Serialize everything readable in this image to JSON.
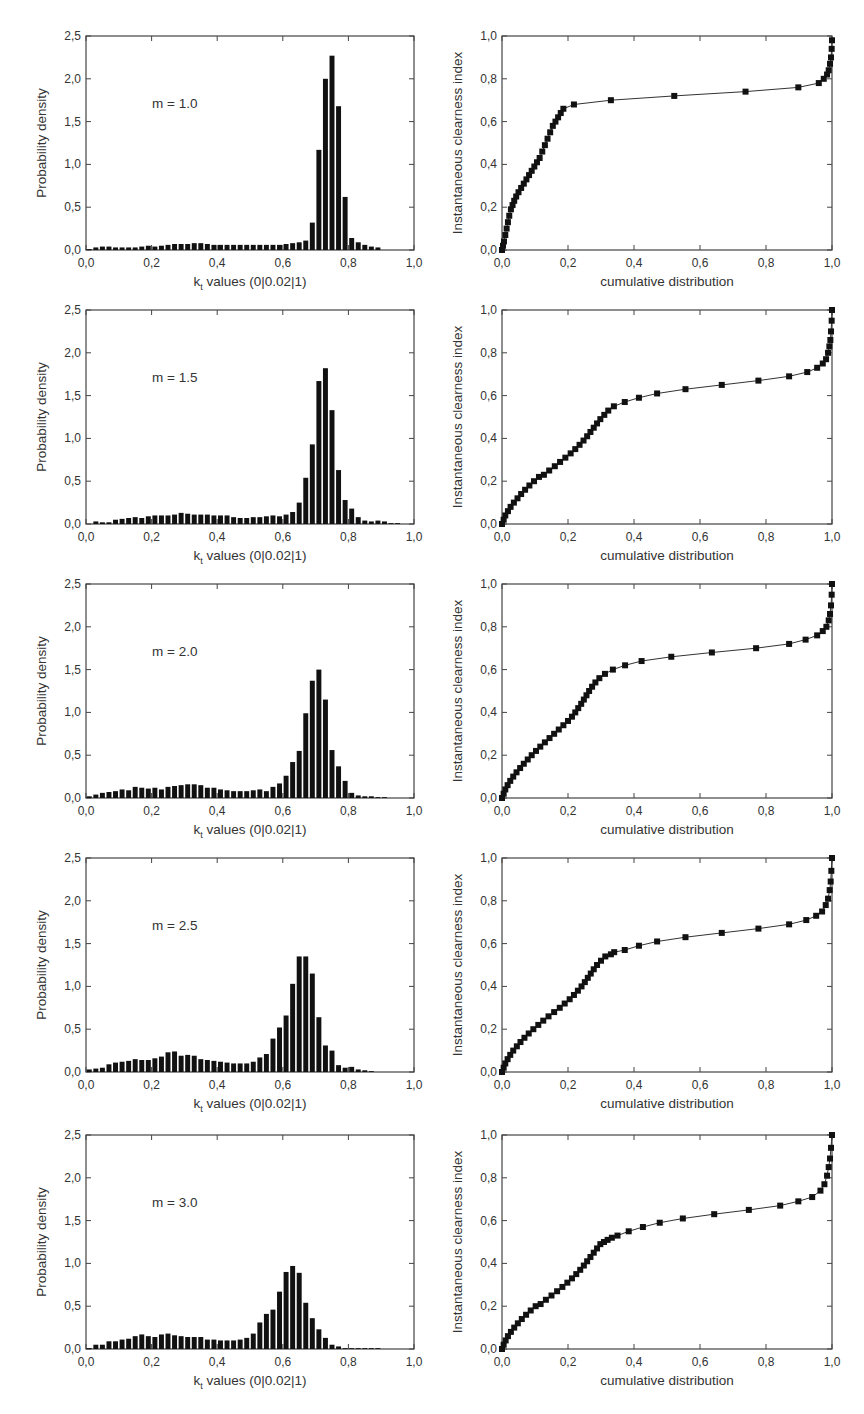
{
  "header": {
    "cut_text": ""
  },
  "layout": {
    "row_tops": [
      36,
      310,
      584,
      858,
      1135
    ],
    "plot_height": 214,
    "left_plot": {
      "x0": 86,
      "x1": 414
    },
    "right_plot": {
      "x0": 502,
      "x1": 832
    }
  },
  "colors": {
    "bar": "#111111",
    "axis": "#444444",
    "marker": "#111111",
    "line": "#333333"
  },
  "chart_data": [
    {
      "type": "bar",
      "panel": "histogram",
      "annotation": "m = 1.0",
      "xlabel": "k_t values (0|0.02|1)",
      "ylabel": "Probability density",
      "xlim": [
        0,
        1
      ],
      "ylim": [
        0,
        2.5
      ],
      "xticks": [
        "0,0",
        "0,2",
        "0,4",
        "0,6",
        "0,8",
        "1,0"
      ],
      "yticks": [
        "0,0",
        "0,5",
        "1,0",
        "1,5",
        "2,0",
        "2,5"
      ],
      "bin_width": 0.02,
      "values": [
        0.01,
        0.03,
        0.04,
        0.04,
        0.03,
        0.03,
        0.03,
        0.03,
        0.04,
        0.05,
        0.04,
        0.05,
        0.06,
        0.07,
        0.07,
        0.07,
        0.08,
        0.08,
        0.07,
        0.06,
        0.06,
        0.06,
        0.06,
        0.06,
        0.06,
        0.06,
        0.06,
        0.06,
        0.06,
        0.06,
        0.07,
        0.08,
        0.09,
        0.11,
        0.32,
        1.17,
        2.0,
        2.27,
        1.68,
        0.62,
        0.14,
        0.09,
        0.06,
        0.04,
        0.03,
        0.0,
        0.0,
        0.0,
        0.0,
        0.0
      ]
    },
    {
      "type": "scatter",
      "panel": "cumulative",
      "mode": "lines+markers",
      "xlabel": "cumulative distribution",
      "ylabel": "Instantaneous clearness index",
      "xlim": [
        0,
        1
      ],
      "ylim": [
        0,
        1
      ],
      "xticks": [
        "0,0",
        "0,2",
        "0,4",
        "0,6",
        "0,8",
        "1,0"
      ],
      "yticks": [
        "0,0",
        "0,2",
        "0,4",
        "0,6",
        "0,8",
        "1,0"
      ],
      "x": [
        0.0,
        0.003,
        0.006,
        0.01,
        0.014,
        0.018,
        0.022,
        0.027,
        0.032,
        0.037,
        0.043,
        0.05,
        0.058,
        0.066,
        0.074,
        0.082,
        0.09,
        0.098,
        0.106,
        0.114,
        0.122,
        0.13,
        0.138,
        0.146,
        0.154,
        0.162,
        0.17,
        0.178,
        0.186,
        0.218,
        0.33,
        0.522,
        0.738,
        0.898,
        0.96,
        0.975,
        0.985,
        0.99,
        0.994,
        0.997,
        0.999,
        1.0
      ],
      "y": [
        0.0,
        0.02,
        0.04,
        0.07,
        0.1,
        0.13,
        0.16,
        0.19,
        0.21,
        0.23,
        0.25,
        0.27,
        0.29,
        0.31,
        0.33,
        0.35,
        0.37,
        0.39,
        0.41,
        0.43,
        0.46,
        0.49,
        0.52,
        0.55,
        0.58,
        0.6,
        0.62,
        0.64,
        0.66,
        0.68,
        0.7,
        0.72,
        0.74,
        0.76,
        0.78,
        0.8,
        0.82,
        0.84,
        0.87,
        0.9,
        0.94,
        0.98
      ]
    },
    {
      "type": "bar",
      "panel": "histogram",
      "annotation": "m = 1.5",
      "xlabel": "k_t values (0|0.02|1)",
      "ylabel": "Probability density",
      "xlim": [
        0,
        1
      ],
      "ylim": [
        0,
        2.5
      ],
      "xticks": [
        "0,0",
        "0,2",
        "0,4",
        "0,6",
        "0,8",
        "1,0"
      ],
      "yticks": [
        "0,0",
        "0,5",
        "1,0",
        "1,5",
        "2,0",
        "2,5"
      ],
      "bin_width": 0.02,
      "values": [
        0.0,
        0.03,
        0.02,
        0.02,
        0.05,
        0.06,
        0.07,
        0.08,
        0.07,
        0.09,
        0.1,
        0.1,
        0.1,
        0.11,
        0.13,
        0.12,
        0.11,
        0.11,
        0.11,
        0.1,
        0.1,
        0.1,
        0.08,
        0.07,
        0.07,
        0.08,
        0.08,
        0.09,
        0.1,
        0.09,
        0.11,
        0.14,
        0.25,
        0.54,
        0.93,
        1.67,
        1.82,
        1.33,
        0.63,
        0.28,
        0.18,
        0.08,
        0.04,
        0.03,
        0.04,
        0.03,
        0.01,
        0.01,
        0.0,
        0.0
      ]
    },
    {
      "type": "scatter",
      "panel": "cumulative",
      "mode": "lines+markers",
      "xlabel": "cumulative distribution",
      "ylabel": "Instantaneous clearness index",
      "xlim": [
        0,
        1
      ],
      "ylim": [
        0,
        1
      ],
      "xticks": [
        "0,0",
        "0,2",
        "0,4",
        "0,6",
        "0,8",
        "1,0"
      ],
      "yticks": [
        "0,0",
        "0,2",
        "0,4",
        "0,6",
        "0,8",
        "1,0"
      ],
      "x": [
        0.0,
        0.005,
        0.01,
        0.018,
        0.026,
        0.036,
        0.047,
        0.058,
        0.07,
        0.083,
        0.097,
        0.112,
        0.127,
        0.143,
        0.16,
        0.176,
        0.192,
        0.208,
        0.222,
        0.235,
        0.247,
        0.258,
        0.268,
        0.278,
        0.288,
        0.298,
        0.31,
        0.322,
        0.339,
        0.372,
        0.415,
        0.47,
        0.556,
        0.666,
        0.777,
        0.87,
        0.925,
        0.955,
        0.972,
        0.982,
        0.988,
        0.992,
        0.995,
        0.997,
        0.999,
        1.0
      ],
      "y": [
        0.0,
        0.02,
        0.04,
        0.06,
        0.08,
        0.1,
        0.12,
        0.14,
        0.16,
        0.18,
        0.2,
        0.22,
        0.23,
        0.25,
        0.27,
        0.29,
        0.31,
        0.33,
        0.35,
        0.37,
        0.39,
        0.41,
        0.43,
        0.45,
        0.47,
        0.49,
        0.51,
        0.53,
        0.55,
        0.57,
        0.59,
        0.61,
        0.63,
        0.65,
        0.67,
        0.69,
        0.71,
        0.73,
        0.75,
        0.77,
        0.8,
        0.83,
        0.86,
        0.9,
        0.95,
        1.0
      ]
    },
    {
      "type": "bar",
      "panel": "histogram",
      "annotation": "m = 2.0",
      "xlabel": "k_t values (0|0.02|1)",
      "ylabel": "Probability density",
      "xlim": [
        0,
        1
      ],
      "ylim": [
        0,
        2.5
      ],
      "xticks": [
        "0,0",
        "0,2",
        "0,4",
        "0,6",
        "0,8",
        "1,0"
      ],
      "yticks": [
        "0,0",
        "0,5",
        "1,0",
        "1,5",
        "2,0",
        "2,5"
      ],
      "bin_width": 0.02,
      "values": [
        0.02,
        0.04,
        0.06,
        0.07,
        0.08,
        0.1,
        0.09,
        0.13,
        0.12,
        0.11,
        0.12,
        0.1,
        0.13,
        0.14,
        0.15,
        0.16,
        0.16,
        0.15,
        0.12,
        0.12,
        0.1,
        0.09,
        0.08,
        0.08,
        0.08,
        0.09,
        0.1,
        0.08,
        0.13,
        0.17,
        0.26,
        0.42,
        0.55,
        0.99,
        1.37,
        1.5,
        1.15,
        0.56,
        0.37,
        0.2,
        0.06,
        0.03,
        0.02,
        0.02,
        0.01,
        0.01,
        0.0,
        0.0,
        0.0,
        0.0
      ]
    },
    {
      "type": "scatter",
      "panel": "cumulative",
      "mode": "lines+markers",
      "xlabel": "cumulative distribution",
      "ylabel": "Instantaneous clearness index",
      "xlim": [
        0,
        1
      ],
      "ylim": [
        0,
        1
      ],
      "xticks": [
        "0,0",
        "0,2",
        "0,4",
        "0,6",
        "0,8",
        "1,0"
      ],
      "yticks": [
        "0,0",
        "0,2",
        "0,4",
        "0,6",
        "0,8",
        "1,0"
      ],
      "x": [
        0.0,
        0.005,
        0.01,
        0.017,
        0.025,
        0.034,
        0.044,
        0.055,
        0.066,
        0.078,
        0.09,
        0.103,
        0.116,
        0.13,
        0.144,
        0.158,
        0.172,
        0.186,
        0.2,
        0.212,
        0.222,
        0.231,
        0.24,
        0.248,
        0.256,
        0.264,
        0.273,
        0.283,
        0.295,
        0.312,
        0.336,
        0.373,
        0.423,
        0.513,
        0.636,
        0.77,
        0.87,
        0.92,
        0.955,
        0.972,
        0.983,
        0.99,
        0.994,
        0.997,
        0.999,
        1.0
      ],
      "y": [
        0.0,
        0.02,
        0.04,
        0.06,
        0.08,
        0.1,
        0.12,
        0.14,
        0.16,
        0.18,
        0.2,
        0.22,
        0.24,
        0.26,
        0.28,
        0.3,
        0.32,
        0.34,
        0.36,
        0.38,
        0.4,
        0.42,
        0.44,
        0.46,
        0.48,
        0.5,
        0.52,
        0.54,
        0.56,
        0.58,
        0.6,
        0.62,
        0.64,
        0.66,
        0.68,
        0.7,
        0.72,
        0.74,
        0.76,
        0.78,
        0.8,
        0.83,
        0.86,
        0.9,
        0.95,
        1.0
      ]
    },
    {
      "type": "bar",
      "panel": "histogram",
      "annotation": "m = 2.5",
      "xlabel": "k_t values (0|0.02|1)",
      "ylabel": "Probability density",
      "xlim": [
        0,
        1
      ],
      "ylim": [
        0,
        2.5
      ],
      "xticks": [
        "0,0",
        "0,2",
        "0,4",
        "0,6",
        "0,8",
        "1,0"
      ],
      "yticks": [
        "0,0",
        "0,5",
        "1,0",
        "1,5",
        "2,0",
        "2,5"
      ],
      "bin_width": 0.02,
      "values": [
        0.03,
        0.04,
        0.05,
        0.09,
        0.11,
        0.12,
        0.13,
        0.15,
        0.14,
        0.14,
        0.16,
        0.18,
        0.23,
        0.24,
        0.19,
        0.2,
        0.19,
        0.15,
        0.14,
        0.13,
        0.12,
        0.11,
        0.1,
        0.1,
        0.1,
        0.12,
        0.17,
        0.21,
        0.39,
        0.52,
        0.66,
        1.03,
        1.35,
        1.35,
        1.15,
        0.64,
        0.31,
        0.25,
        0.08,
        0.05,
        0.06,
        0.03,
        0.02,
        0.01,
        0.0,
        0.0,
        0.0,
        0.0,
        0.0,
        0.0
      ]
    },
    {
      "type": "scatter",
      "panel": "cumulative",
      "mode": "lines+markers",
      "xlabel": "cumulative distribution",
      "ylabel": "Instantaneous clearness index",
      "xlim": [
        0,
        1
      ],
      "ylim": [
        0,
        1
      ],
      "xticks": [
        "0,0",
        "0,2",
        "0,4",
        "0,6",
        "0,8",
        "1,0"
      ],
      "yticks": [
        "0,0",
        "0,2",
        "0,4",
        "0,6",
        "0,8",
        "1,0"
      ],
      "x": [
        0.0,
        0.005,
        0.01,
        0.017,
        0.025,
        0.034,
        0.045,
        0.056,
        0.068,
        0.081,
        0.095,
        0.11,
        0.125,
        0.141,
        0.158,
        0.175,
        0.19,
        0.205,
        0.218,
        0.23,
        0.241,
        0.251,
        0.26,
        0.269,
        0.278,
        0.288,
        0.3,
        0.313,
        0.33,
        0.34,
        0.372,
        0.415,
        0.47,
        0.556,
        0.666,
        0.777,
        0.87,
        0.922,
        0.952,
        0.97,
        0.981,
        0.988,
        0.993,
        0.996,
        0.998,
        1.0
      ],
      "y": [
        0.0,
        0.02,
        0.04,
        0.06,
        0.08,
        0.1,
        0.12,
        0.14,
        0.16,
        0.18,
        0.2,
        0.22,
        0.24,
        0.26,
        0.28,
        0.3,
        0.32,
        0.34,
        0.36,
        0.38,
        0.4,
        0.42,
        0.44,
        0.46,
        0.48,
        0.5,
        0.52,
        0.54,
        0.55,
        0.56,
        0.57,
        0.59,
        0.61,
        0.63,
        0.65,
        0.67,
        0.69,
        0.71,
        0.73,
        0.75,
        0.78,
        0.81,
        0.85,
        0.89,
        0.94,
        1.0
      ]
    },
    {
      "type": "bar",
      "panel": "histogram",
      "annotation": "m = 3.0",
      "xlabel": "k_t values (0|0.02|1)",
      "ylabel": "Probability density",
      "xlim": [
        0,
        1
      ],
      "ylim": [
        0,
        2.5
      ],
      "xticks": [
        "0,0",
        "0,2",
        "0,4",
        "0,6",
        "0,8",
        "1,0"
      ],
      "yticks": [
        "0,0",
        "0,5",
        "1,0",
        "1,5",
        "2,0",
        "2,5"
      ],
      "bin_width": 0.02,
      "values": [
        0.01,
        0.05,
        0.05,
        0.09,
        0.09,
        0.11,
        0.12,
        0.15,
        0.17,
        0.15,
        0.14,
        0.17,
        0.18,
        0.16,
        0.15,
        0.14,
        0.14,
        0.14,
        0.11,
        0.11,
        0.1,
        0.1,
        0.1,
        0.11,
        0.13,
        0.18,
        0.31,
        0.41,
        0.46,
        0.67,
        0.9,
        0.97,
        0.89,
        0.54,
        0.36,
        0.23,
        0.13,
        0.05,
        0.03,
        0.01,
        0.01,
        0.01,
        0.01,
        0.01,
        0.01,
        0.0,
        0.0,
        0.0,
        0.0,
        0.0
      ]
    },
    {
      "type": "scatter",
      "panel": "cumulative",
      "mode": "lines+markers",
      "xlabel": "cumulative distribution",
      "ylabel": "Instantaneous clearness index",
      "xlim": [
        0,
        1
      ],
      "ylim": [
        0,
        1
      ],
      "xticks": [
        "0,0",
        "0,2",
        "0,4",
        "0,6",
        "0,8",
        "1,0"
      ],
      "yticks": [
        "0,0",
        "0,2",
        "0,4",
        "0,6",
        "0,8",
        "1,0"
      ],
      "x": [
        0.0,
        0.005,
        0.011,
        0.018,
        0.027,
        0.037,
        0.048,
        0.06,
        0.073,
        0.087,
        0.102,
        0.117,
        0.133,
        0.15,
        0.167,
        0.183,
        0.198,
        0.212,
        0.225,
        0.237,
        0.248,
        0.258,
        0.268,
        0.278,
        0.288,
        0.298,
        0.309,
        0.32,
        0.333,
        0.35,
        0.384,
        0.427,
        0.478,
        0.548,
        0.643,
        0.748,
        0.843,
        0.898,
        0.94,
        0.965,
        0.977,
        0.985,
        0.99,
        0.994,
        0.997,
        1.0
      ],
      "y": [
        0.0,
        0.02,
        0.04,
        0.06,
        0.08,
        0.1,
        0.12,
        0.14,
        0.16,
        0.18,
        0.2,
        0.21,
        0.23,
        0.25,
        0.27,
        0.29,
        0.31,
        0.33,
        0.35,
        0.37,
        0.39,
        0.41,
        0.43,
        0.45,
        0.47,
        0.49,
        0.5,
        0.51,
        0.52,
        0.53,
        0.55,
        0.57,
        0.59,
        0.61,
        0.63,
        0.65,
        0.67,
        0.69,
        0.71,
        0.74,
        0.77,
        0.81,
        0.85,
        0.89,
        0.94,
        1.0
      ]
    }
  ]
}
